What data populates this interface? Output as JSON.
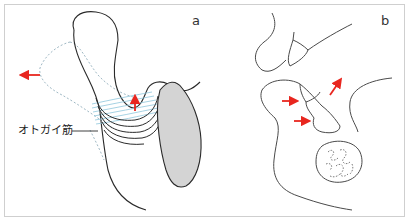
{
  "figure": {
    "panels": [
      {
        "id": "a",
        "label": "a"
      },
      {
        "id": "b",
        "label": "b"
      }
    ],
    "annotations": {
      "muscle_label": "オトガイ筋"
    },
    "colors": {
      "outline": "#2a2a2a",
      "dotted_outline": "#9fb8c4",
      "muscle_fibers": "#8fc7dc",
      "bone_fill": "#d4d4d4",
      "arrow": "#e8261f",
      "frame": "#cfcfcf"
    },
    "arrows": {
      "panel_a": [
        "left",
        "up"
      ],
      "panel_b": [
        "right",
        "right",
        "up-right"
      ]
    }
  }
}
